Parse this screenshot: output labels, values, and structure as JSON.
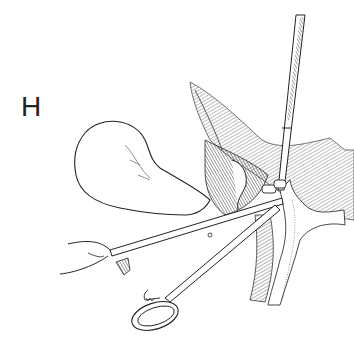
{
  "figure": {
    "panel_label": "H",
    "colors": {
      "ink": "#222222",
      "background": "#ffffff",
      "shade": "#555555"
    }
  }
}
